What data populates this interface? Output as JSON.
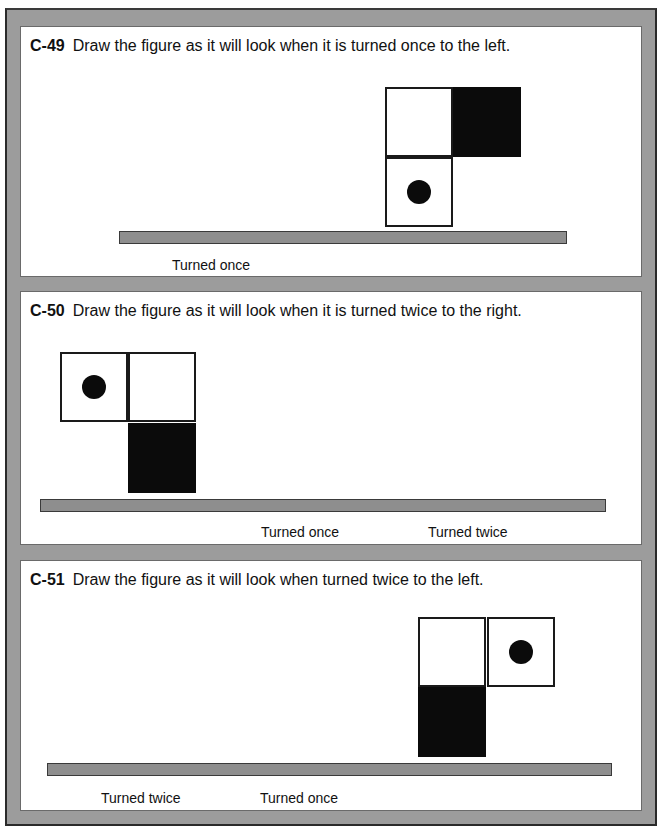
{
  "problems": [
    {
      "id": "C-49",
      "instruction": "Draw the figure as it will look when it is turned once to the left.",
      "labels": [
        "Turned once"
      ]
    },
    {
      "id": "C-50",
      "instruction": "Draw the figure as it will look when it is turned twice to the right.",
      "labels": [
        "Turned once",
        "Turned twice"
      ]
    },
    {
      "id": "C-51",
      "instruction": "Draw the figure as it will look when turned twice to the left.",
      "labels": [
        "Turned twice",
        "Turned once"
      ]
    }
  ],
  "colors": {
    "frame": "#9c9c9c",
    "base_bar": "#8e8e8e",
    "filled_square": "#0b0b0b",
    "panel": "#ffffff"
  }
}
